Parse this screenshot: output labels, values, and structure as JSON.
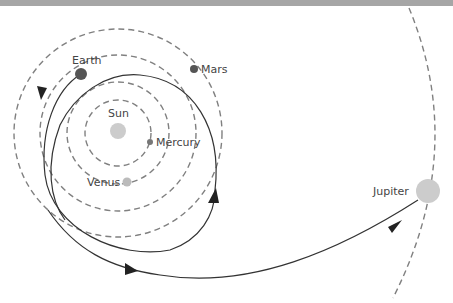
{
  "colors": {
    "orbit": "#808080",
    "trajectory": "#333333",
    "dark_planet": "#555555",
    "light_planet": "#cccccc",
    "label": "#444444",
    "topbar": "#a6a6a6"
  },
  "bodies": [
    {
      "name": "Sun",
      "label": "Sun"
    },
    {
      "name": "Mercury",
      "label": "Mercury"
    },
    {
      "name": "Venus",
      "label": "Venus"
    },
    {
      "name": "Earth",
      "label": "Earth"
    },
    {
      "name": "Mars",
      "label": "Mars"
    },
    {
      "name": "Jupiter",
      "label": "Jupiter"
    }
  ],
  "labels": {
    "sun": "Sun",
    "mercury": "Mercury",
    "venus": "Venus",
    "earth": "Earth",
    "mars": "Mars",
    "jupiter": "Jupiter"
  }
}
